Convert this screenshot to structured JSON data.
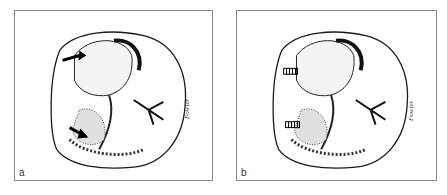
{
  "figure": {
    "panels": [
      {
        "id": "a",
        "label": "a",
        "signature": "Fowler",
        "arrow_style": "solid-arrows",
        "arrow_count": 2
      },
      {
        "id": "b",
        "label": "b",
        "signature": "Fowler",
        "arrow_style": "hatched-arrows",
        "arrow_count": 2
      },
      {
        "note": "illustration: line drawing of a tooth crown with fissure patterns"
      }
    ],
    "caption": ""
  },
  "colors": {
    "frame": "#8a8a8a",
    "ink": "#1a1a1a",
    "background": "#ffffff"
  }
}
